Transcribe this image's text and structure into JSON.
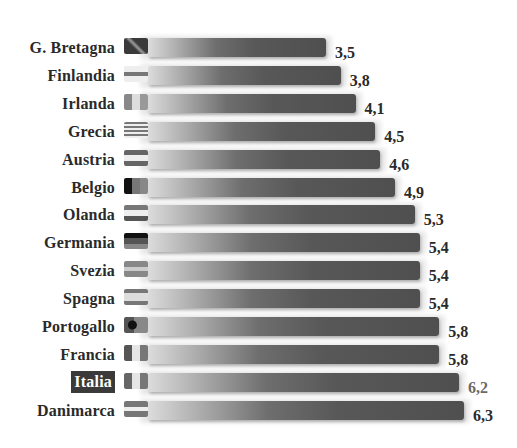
{
  "chart_data": {
    "type": "bar",
    "orientation": "horizontal",
    "title": "",
    "xlabel": "",
    "ylabel": "",
    "grid": false,
    "legend": null,
    "highlight": "Italia",
    "decimal_separator": ",",
    "categories": [
      "G. Bretagna",
      "Finlandia",
      "Irlanda",
      "Grecia",
      "Austria",
      "Belgio",
      "Olanda",
      "Germania",
      "Svezia",
      "Spagna",
      "Portogallo",
      "Francia",
      "Italia",
      "Danimarca"
    ],
    "values": [
      3.5,
      3.8,
      4.1,
      4.5,
      4.6,
      4.9,
      5.3,
      5.4,
      5.4,
      5.4,
      5.8,
      5.8,
      6.2,
      6.3
    ],
    "value_labels": [
      "3,5",
      "3,8",
      "4,1",
      "4,5",
      "4,6",
      "4,9",
      "5,3",
      "5,4",
      "5,4",
      "5,4",
      "5,8",
      "5,8",
      "6,2",
      "6,3"
    ],
    "flags": [
      "uk-flag",
      "finland-flag",
      "ireland-flag",
      "greece-flag",
      "austria-flag",
      "belgium-flag",
      "netherlands-flag",
      "germany-flag",
      "sweden-flag",
      "spain-flag",
      "portugal-flag",
      "france-flag",
      "italy-flag",
      "denmark-flag"
    ]
  },
  "style": {
    "bar_dark": "#4f4f4f",
    "bar_light": "#dcdcdc",
    "highlight_bg": "#3a3a3a",
    "highlight_text": "#ffffff"
  }
}
